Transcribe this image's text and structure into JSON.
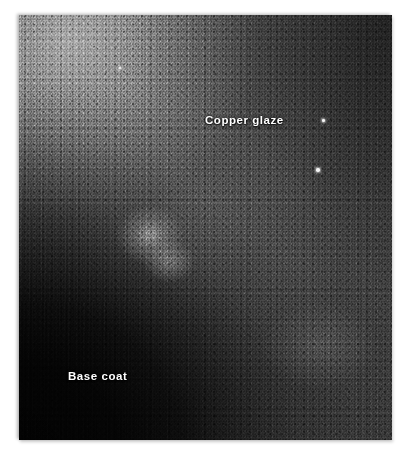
{
  "figure": {
    "kind": "photomicrograph",
    "palette": {
      "page_background": "#ffffff",
      "plate_dark": "#050505",
      "plate_mid": "#4a4a4a",
      "plate_light": "#a8a8a8",
      "label_color": "#ffffff",
      "speck_color": "#f4f4f4"
    },
    "plate": {
      "left": 19,
      "top": 15,
      "width": 373,
      "height": 425
    }
  },
  "annotations": [
    {
      "id": "copper-glaze",
      "text": "Copper glaze",
      "x": 186,
      "y": 99,
      "region": "upper-right granular glaze layer"
    },
    {
      "id": "base-coat",
      "text": "Base coat",
      "x": 49,
      "y": 355,
      "region": "dark lower-left underlayer"
    }
  ],
  "specks": [
    {
      "id": "speck-upper",
      "x": 303,
      "y": 104,
      "size": 2.5
    },
    {
      "id": "speck-lower",
      "x": 297,
      "y": 153,
      "size": 3.5
    },
    {
      "id": "speck-faint",
      "x": 100,
      "y": 52,
      "size": 1.8
    }
  ]
}
